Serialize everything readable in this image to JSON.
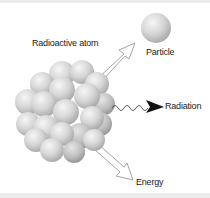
{
  "diagram": {
    "labels": {
      "atom": "Radioactive atom",
      "particle": "Particle",
      "radiation": "Radiation",
      "energy": "Energy"
    },
    "colors": {
      "sphere_light": "#f2f2f2",
      "sphere_dark": "#a8a8a8",
      "arrow_outline": "#9a9a9a",
      "radiation_arrowhead": "#111111",
      "band": "#ececec"
    }
  }
}
